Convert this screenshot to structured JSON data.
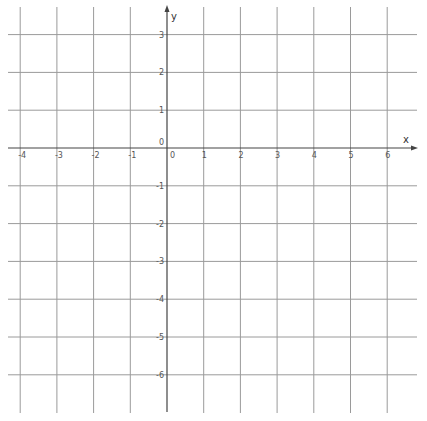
{
  "graph": {
    "title": "",
    "x_axis_label": "x",
    "y_axis_label": "y",
    "origin_label_x": "0",
    "origin_label_y": "0",
    "x_ticks": [
      -4,
      -3,
      -2,
      -1,
      0,
      1,
      2,
      3,
      4,
      5,
      6
    ],
    "y_ticks": [
      3,
      2,
      1,
      -1,
      -2,
      -3,
      -4,
      -5,
      -6
    ],
    "x_tick_labels": [
      "-4",
      "-3",
      "-2",
      "-1",
      "0",
      "1",
      "2",
      "3",
      "4",
      "5",
      "6"
    ],
    "y_tick_labels": [
      "3",
      "2",
      "1",
      "-1",
      "-2",
      "-3",
      "-4",
      "-5",
      "-6"
    ],
    "xlim": [
      -4.3,
      6.8
    ],
    "ylim": [
      -7,
      3.7
    ],
    "grid": true,
    "colors": {
      "grid": "#9a9a9a",
      "axis": "#444444",
      "labels": "#555555"
    }
  }
}
